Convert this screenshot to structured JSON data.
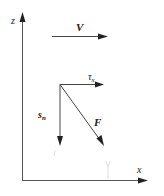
{
  "diagram": {
    "axes": {
      "z_label": "z",
      "x_label": "x"
    },
    "vectors": {
      "velocity": {
        "label": "V"
      },
      "shear_stress": {
        "label": "τ",
        "subscript": "x"
      },
      "normal_stress": {
        "label": "s",
        "subscript": "n"
      },
      "force": {
        "label": "F"
      }
    },
    "colors": {
      "line": "#555555",
      "arrowhead": "#222222",
      "background": "#ffffff"
    }
  }
}
